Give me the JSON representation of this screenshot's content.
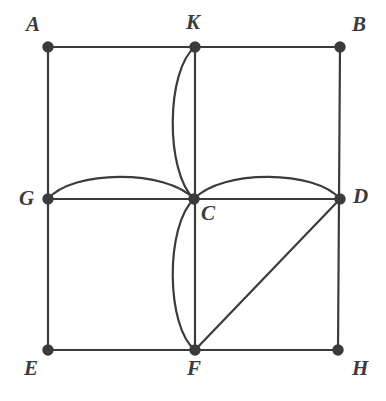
{
  "figure": {
    "background_color": "#ffffff",
    "stroke_color": "#3b3b3b",
    "stroke_width": 2.2,
    "vertex_dot_radius": 4.6,
    "label_color": "#3b3b3b",
    "label_font_size": 21
  },
  "points": {
    "A": {
      "label": "A",
      "x": 48,
      "y": 47,
      "label_x": 26,
      "label_y": 14,
      "dot": true
    },
    "B": {
      "label": "B",
      "x": 340,
      "y": 47,
      "label_x": 352,
      "label_y": 14,
      "dot": true
    },
    "K": {
      "label": "K",
      "x": 195,
      "y": 47,
      "label_x": 186,
      "label_y": 12,
      "dot": true
    },
    "G": {
      "label": "G",
      "x": 48,
      "y": 199,
      "label_x": 19,
      "label_y": 188,
      "dot": true
    },
    "C": {
      "label": "C",
      "x": 194,
      "y": 199,
      "label_x": 201,
      "label_y": 203,
      "dot": true
    },
    "D": {
      "label": "D",
      "x": 340,
      "y": 199,
      "label_x": 353,
      "label_y": 186,
      "dot": true
    },
    "E": {
      "label": "E",
      "x": 48,
      "y": 350,
      "label_x": 24,
      "label_y": 358,
      "dot": true
    },
    "F": {
      "label": "F",
      "x": 195,
      "y": 350,
      "label_x": 187,
      "label_y": 358,
      "dot": true
    },
    "H": {
      "label": "H",
      "x": 338,
      "y": 350,
      "label_x": 352,
      "label_y": 358,
      "dot": true
    }
  },
  "segments": [
    {
      "name": "side-top-A-B",
      "from": "A",
      "to": "B",
      "path": "M 48 47 L 340 47"
    },
    {
      "name": "side-left-A-E",
      "from": "A",
      "to": "E",
      "path": "M 48 47 L 48 350"
    },
    {
      "name": "side-right-B-H",
      "from": "B",
      "to": "H",
      "path": "M 340 47 L 338 350"
    },
    {
      "name": "side-bottom-E-H",
      "from": "E",
      "to": "H",
      "path": "M 48 350 L 338 350"
    },
    {
      "name": "median-vertical-K-F",
      "from": "K",
      "to": "F",
      "path": "M 195 47 L 195 350"
    },
    {
      "name": "median-horizontal-G-D",
      "from": "G",
      "to": "D",
      "path": "M 48 199 L 340 199"
    },
    {
      "name": "diagonal-D-F",
      "from": "D",
      "to": "F",
      "path": "M 340 199 L 195 350"
    }
  ],
  "arcs": [
    {
      "name": "arc-K-C-bulge-left",
      "from": "K",
      "to": "C",
      "bulge": "left",
      "path": "M 195 47 C 166 70 165 172 194 199"
    },
    {
      "name": "arc-C-F-bulge-left",
      "from": "C",
      "to": "F",
      "bulge": "left",
      "path": "M 194 199 C 165 226 166 327 195 350"
    },
    {
      "name": "arc-G-C-bulge-up",
      "from": "G",
      "to": "C",
      "bulge": "up",
      "path": "M 48 199 C 72 170 166 169 194 199"
    },
    {
      "name": "arc-C-D-bulge-up",
      "from": "C",
      "to": "D",
      "bulge": "up",
      "path": "M 194 199 C 222 169 316 170 340 199"
    }
  ]
}
